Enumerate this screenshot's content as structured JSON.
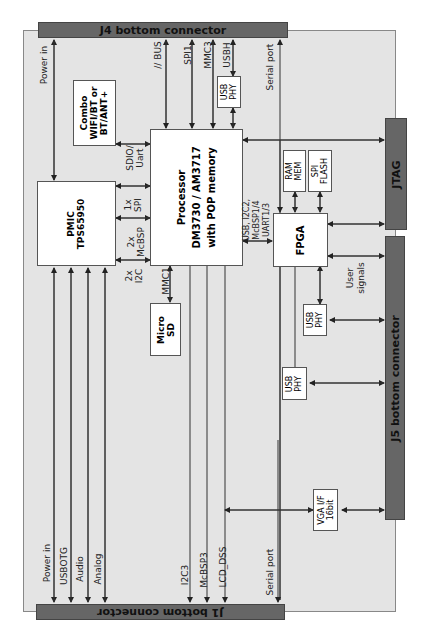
{
  "connectors": {
    "j4": "J4 bottom connector",
    "j1": "J1 bottom connector",
    "j5": "J5 bottom connector",
    "jtag": "JTAG"
  },
  "blocks": {
    "combo": [
      "Combo",
      "WIFI/BT or",
      "BT/ANT+"
    ],
    "pmic": [
      "PMIC",
      "TPS65950"
    ],
    "processor": [
      "Processor",
      "DM3730 / AM3717",
      "with POP memory"
    ],
    "microsd": [
      "Micro",
      "SD"
    ],
    "fpga": "FPGA",
    "ram": [
      "RAM",
      "MEM"
    ],
    "spiflash": [
      "SPI",
      "FLASH"
    ],
    "usbphy_top": [
      "USB",
      "PHY"
    ],
    "usbphy_mid": [
      "USB",
      "PHY"
    ],
    "usbphy_low": [
      "USB",
      "PHY"
    ],
    "vga": [
      "VGA I/F",
      "16bit"
    ]
  },
  "signals": {
    "power_in_top": "Power in",
    "bus": "// BUS",
    "spi1": "SPI1",
    "mmc3": "MMC3",
    "usbh": "USBH",
    "serial_top": "Serial port",
    "sdio": [
      "SDIO/",
      "Uart"
    ],
    "spi_1x": [
      "1x",
      "SPI"
    ],
    "mcbsp_2x": [
      "2x",
      "McBSP"
    ],
    "i2c_2x": [
      "2x",
      "I2C"
    ],
    "mmc1": "MMC1",
    "fpga_if": [
      "USB, I2C2,",
      "McBSP1/4",
      "UART1/3"
    ],
    "user_signals": [
      "User",
      "signals"
    ],
    "power_in_bottom": "Power in",
    "usbotg": "USBOTG",
    "audio": "Audio",
    "analog": "Analog",
    "i2c3": "I2C3",
    "mcbsp3": "McBSP3",
    "lcd_dss": "LCD_DSS",
    "serial_bottom": "Serial port"
  },
  "colors": {
    "board_bg": "#e4e4e4",
    "connector": "#666666",
    "block": "#ffffff",
    "line": "#333333"
  }
}
